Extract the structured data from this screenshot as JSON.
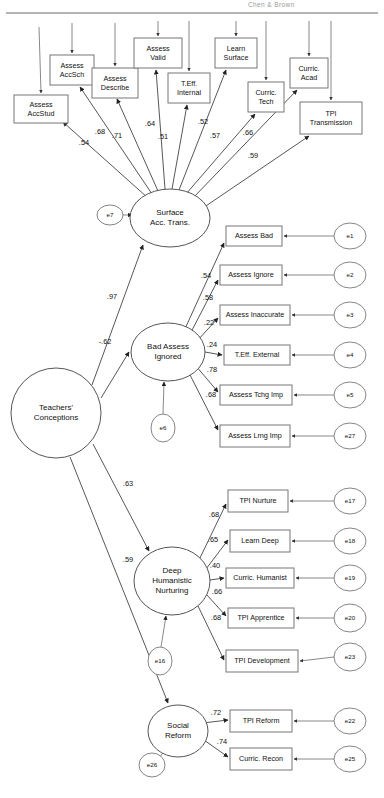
{
  "header": {
    "title": "Chen & Brown"
  },
  "diagram": {
    "type": "sem-path-diagram",
    "latents": [
      {
        "id": "surface",
        "label_lines": [
          "Surface",
          "Acc. Trans."
        ],
        "cx": 170,
        "cy": 218,
        "rx": 40,
        "ry": 29
      },
      {
        "id": "bad",
        "label_lines": [
          "Bad Assess",
          "Ignored"
        ],
        "cx": 168,
        "cy": 352,
        "rx": 37,
        "ry": 29
      },
      {
        "id": "deep",
        "label_lines": [
          "Deep",
          "Humanistic",
          "Nurturing"
        ],
        "cx": 172,
        "cy": 581,
        "rx": 38,
        "ry": 34
      },
      {
        "id": "social",
        "label_lines": [
          "Social",
          "Reform"
        ],
        "cx": 178,
        "cy": 731,
        "rx": 30,
        "ry": 26
      },
      {
        "id": "teachers",
        "label_lines": [
          "Teachers'",
          "Conceptions"
        ],
        "cx": 56,
        "cy": 413,
        "rx": 45,
        "ry": 45
      }
    ],
    "indicators": [
      {
        "id": "assess-accstud",
        "label_lines": [
          "Assess",
          "AccStud"
        ],
        "x": 14,
        "y": 95,
        "w": 54,
        "h": 28
      },
      {
        "id": "assess-accsch",
        "label_lines": [
          "Assess",
          "AccSch"
        ],
        "x": 50,
        "y": 55,
        "w": 44,
        "h": 30
      },
      {
        "id": "assess-describe",
        "label_lines": [
          "Assess",
          "Describe"
        ],
        "x": 92,
        "y": 68,
        "w": 46,
        "h": 30
      },
      {
        "id": "assess-valid",
        "label_lines": [
          "Assess",
          "Valid"
        ],
        "x": 134,
        "y": 38,
        "w": 48,
        "h": 30
      },
      {
        "id": "teff-internal",
        "label_lines": [
          "T.Eff.",
          "Internal"
        ],
        "x": 168,
        "y": 73,
        "w": 42,
        "h": 30
      },
      {
        "id": "learn-surface",
        "label_lines": [
          "Learn",
          "Surface"
        ],
        "x": 215,
        "y": 38,
        "w": 42,
        "h": 30
      },
      {
        "id": "curric-tech",
        "label_lines": [
          "Curric.",
          "Tech"
        ],
        "x": 248,
        "y": 82,
        "w": 36,
        "h": 30
      },
      {
        "id": "curric-acad",
        "label_lines": [
          "Curric.",
          "Acad"
        ],
        "x": 290,
        "y": 58,
        "w": 38,
        "h": 30
      },
      {
        "id": "tpi-transmission",
        "label_lines": [
          "TPI",
          "Transmission"
        ],
        "x": 300,
        "y": 102,
        "w": 62,
        "h": 32
      },
      {
        "id": "assess-bad",
        "label_lines": [
          "Assess Bad"
        ],
        "x": 226,
        "y": 226,
        "w": 56,
        "h": 20
      },
      {
        "id": "assess-ignore",
        "label_lines": [
          "Assess Ignore"
        ],
        "x": 220,
        "y": 265,
        "w": 62,
        "h": 20
      },
      {
        "id": "assess-inaccurate",
        "label_lines": [
          "Assess Inaccurate"
        ],
        "x": 220,
        "y": 305,
        "w": 70,
        "h": 20
      },
      {
        "id": "teff-external",
        "label_lines": [
          "T.Eff. External"
        ],
        "x": 224,
        "y": 345,
        "w": 66,
        "h": 20
      },
      {
        "id": "assess-tchg-imp",
        "label_lines": [
          "Assess Tchg Imp"
        ],
        "x": 220,
        "y": 385,
        "w": 72,
        "h": 20
      },
      {
        "id": "assess-lrng-imp",
        "label_lines": [
          "Assess Lrng Imp"
        ],
        "x": 220,
        "y": 425,
        "w": 70,
        "h": 22
      },
      {
        "id": "tpi-nurture",
        "label_lines": [
          "TPI Nurture"
        ],
        "x": 228,
        "y": 490,
        "w": 60,
        "h": 22
      },
      {
        "id": "learn-deep",
        "label_lines": [
          "Learn Deep"
        ],
        "x": 230,
        "y": 530,
        "w": 60,
        "h": 22
      },
      {
        "id": "curric-humanist",
        "label_lines": [
          "Curric. Humanist"
        ],
        "x": 226,
        "y": 568,
        "w": 68,
        "h": 20
      },
      {
        "id": "tpi-apprentice",
        "label_lines": [
          "TPI Apprentice"
        ],
        "x": 228,
        "y": 608,
        "w": 66,
        "h": 20
      },
      {
        "id": "tpi-development",
        "label_lines": [
          "TPI Development"
        ],
        "x": 226,
        "y": 650,
        "w": 72,
        "h": 22
      },
      {
        "id": "tpi-reform",
        "label_lines": [
          "TPI Reform"
        ],
        "x": 230,
        "y": 710,
        "w": 62,
        "h": 22
      },
      {
        "id": "curric-recon",
        "label_lines": [
          "Curric. Recon"
        ],
        "x": 230,
        "y": 748,
        "w": 62,
        "h": 22
      }
    ],
    "errors": [
      {
        "id": "e7",
        "label": "e7",
        "cx": 110,
        "cy": 215,
        "rx": 13,
        "ry": 10
      },
      {
        "id": "e6",
        "label": "e6",
        "cx": 163,
        "cy": 428,
        "rx": 12,
        "ry": 14
      },
      {
        "id": "e16",
        "label": "e16",
        "cx": 160,
        "cy": 661,
        "rx": 12,
        "ry": 14
      },
      {
        "id": "e26",
        "label": "e26",
        "cx": 152,
        "cy": 765,
        "rx": 13,
        "ry": 12
      },
      {
        "id": "e1",
        "label": "e1",
        "cx": 350,
        "cy": 236,
        "rx": 16,
        "ry": 13
      },
      {
        "id": "e2",
        "label": "e2",
        "cx": 350,
        "cy": 275,
        "rx": 16,
        "ry": 13
      },
      {
        "id": "e3",
        "label": "e3",
        "cx": 350,
        "cy": 315,
        "rx": 16,
        "ry": 13
      },
      {
        "id": "e4",
        "label": "e4",
        "cx": 350,
        "cy": 355,
        "rx": 16,
        "ry": 13
      },
      {
        "id": "e5",
        "label": "e5",
        "cx": 350,
        "cy": 395,
        "rx": 16,
        "ry": 13
      },
      {
        "id": "e27",
        "label": "e27",
        "cx": 350,
        "cy": 436,
        "rx": 16,
        "ry": 13
      },
      {
        "id": "e17",
        "label": "e17",
        "cx": 350,
        "cy": 501,
        "rx": 16,
        "ry": 13
      },
      {
        "id": "e18",
        "label": "e18",
        "cx": 350,
        "cy": 541,
        "rx": 16,
        "ry": 13
      },
      {
        "id": "e19",
        "label": "e19",
        "cx": 350,
        "cy": 578,
        "rx": 16,
        "ry": 13
      },
      {
        "id": "e20",
        "label": "e20",
        "cx": 350,
        "cy": 618,
        "rx": 16,
        "ry": 14
      },
      {
        "id": "e23",
        "label": "e23",
        "cx": 350,
        "cy": 657,
        "rx": 16,
        "ry": 14
      },
      {
        "id": "e22",
        "label": "e22",
        "cx": 350,
        "cy": 721,
        "rx": 16,
        "ry": 13
      },
      {
        "id": "e25",
        "label": "e25",
        "cx": 350,
        "cy": 759,
        "rx": 16,
        "ry": 13
      }
    ],
    "coefficients": [
      {
        "id": "c-accstud",
        "value": ".54",
        "x": 84,
        "y": 143
      },
      {
        "id": "c-accsch",
        "value": ".68",
        "x": 100,
        "y": 132
      },
      {
        "id": "c-describe",
        "value": ".71",
        "x": 117,
        "y": 136
      },
      {
        "id": "c-valid",
        "value": ".64",
        "x": 150,
        "y": 124
      },
      {
        "id": "c-teffint",
        "value": ".51",
        "x": 163,
        "y": 137
      },
      {
        "id": "c-learnsurf",
        "value": ".52",
        "x": 203,
        "y": 122
      },
      {
        "id": "c-curtech",
        "value": ".57",
        "x": 215,
        "y": 136
      },
      {
        "id": "c-curacad",
        "value": ".66",
        "x": 248,
        "y": 133
      },
      {
        "id": "c-tpitrans",
        "value": ".59",
        "x": 253,
        "y": 156
      },
      {
        "id": "c-bad-1",
        "value": ".54",
        "x": 206,
        "y": 276
      },
      {
        "id": "c-bad-2",
        "value": ".58",
        "x": 208,
        "y": 298
      },
      {
        "id": "c-bad-3",
        "value": ".22",
        "x": 209,
        "y": 323
      },
      {
        "id": "c-bad-4",
        "value": ".24",
        "x": 212,
        "y": 345
      },
      {
        "id": "c-bad-5",
        "value": ".78",
        "x": 212,
        "y": 370
      },
      {
        "id": "c-bad-6",
        "value": ".68",
        "x": 211,
        "y": 395
      },
      {
        "id": "c-deep-1",
        "value": ".68",
        "x": 214,
        "y": 515
      },
      {
        "id": "c-deep-2",
        "value": ".65",
        "x": 213,
        "y": 540
      },
      {
        "id": "c-deep-3",
        "value": ".40",
        "x": 215,
        "y": 566
      },
      {
        "id": "c-deep-4",
        "value": ".66",
        "x": 217,
        "y": 592
      },
      {
        "id": "c-deep-5",
        "value": ".68",
        "x": 216,
        "y": 618
      },
      {
        "id": "c-soc-1",
        "value": ".72",
        "x": 216,
        "y": 713
      },
      {
        "id": "c-soc-2",
        "value": ".74",
        "x": 222,
        "y": 742
      },
      {
        "id": "c-struct-surface",
        "value": ".97",
        "x": 112,
        "y": 297
      },
      {
        "id": "c-struct-bad",
        "value": "-.62",
        "x": 105,
        "y": 342
      },
      {
        "id": "c-struct-deep",
        "value": ".63",
        "x": 128,
        "y": 484
      },
      {
        "id": "c-struct-social",
        "value": ".59",
        "x": 128,
        "y": 560
      }
    ]
  }
}
